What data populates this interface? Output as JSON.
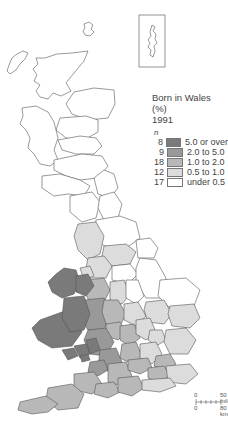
{
  "map": {
    "title": "Born in Wales (%)",
    "year": "1991",
    "region": "Great Britain",
    "inset_label": "Shetland inset"
  },
  "legend": {
    "n_header": "n",
    "items": [
      {
        "count": "8",
        "label": "5.0 or over",
        "color": "#7a7a7a"
      },
      {
        "count": "9",
        "label": "2.0 to 5.0",
        "color": "#999999"
      },
      {
        "count": "18",
        "label": "1.0 to 2.0",
        "color": "#b8b8b8"
      },
      {
        "count": "12",
        "label": "0.5 to 1.0",
        "color": "#dcdcdc"
      },
      {
        "count": "17",
        "label": "under 0.5",
        "color": "#ffffff"
      }
    ]
  },
  "scale": {
    "zero_top": "0",
    "miles_label": "50 miles",
    "zero_bottom": "0",
    "km_label": "80 km"
  }
}
